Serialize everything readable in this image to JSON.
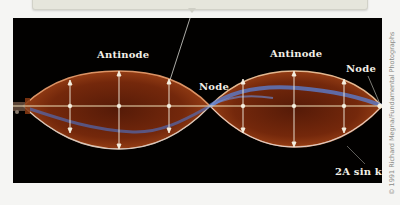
{
  "figure": {
    "labels": {
      "antinode_left": "Antinode",
      "antinode_right": "Antinode",
      "node_center": "Node",
      "node_right": "Node",
      "envelope": "2A sin kx"
    },
    "credit": "© 1991 Richard Megna/Fundamental Photographs",
    "colors": {
      "background": "#f5f5f3",
      "photo_background": "#020100",
      "string_orange": "#c0501c",
      "string_blue": "#5a7fd0",
      "axis_line": "#f0e0b8",
      "arrows": "#f5efe0",
      "label_text": "#f2efe6"
    },
    "geometry": {
      "axis_y": 88,
      "nodes_x": [
        10,
        197,
        369
      ],
      "antinodes_x": [
        106,
        281
      ],
      "amplitude_px": 37
    }
  }
}
